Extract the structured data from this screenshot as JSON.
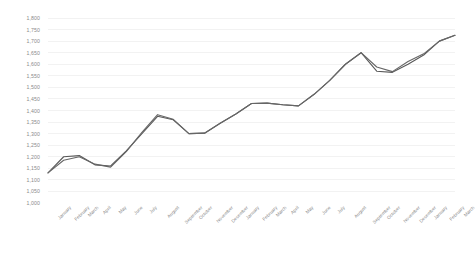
{
  "chart_data": {
    "type": "line",
    "title": "",
    "subtitle": "",
    "xlabel": "",
    "ylabel": "",
    "ylim": [
      1000,
      1800
    ],
    "ytick_step": 50,
    "grid": true,
    "legend": "none",
    "yticks": [
      "1,800",
      "1,750",
      "1,700",
      "1,650",
      "1,600",
      "1,550",
      "1,500",
      "1,450",
      "1,400",
      "1,350",
      "1,300",
      "1,250",
      "1,200",
      "1,150",
      "1,100",
      "1,050",
      "1,000"
    ],
    "ytick_values": [
      1800,
      1750,
      1700,
      1650,
      1600,
      1550,
      1500,
      1450,
      1400,
      1350,
      1300,
      1250,
      1200,
      1150,
      1100,
      1050,
      1000
    ],
    "categories": [
      "January",
      "February",
      "March",
      "April",
      "May",
      "June",
      "July",
      "August",
      "September",
      "October",
      "November",
      "December",
      "January",
      "February",
      "March",
      "April",
      "May",
      "June",
      "July",
      "August",
      "September",
      "October",
      "November",
      "December",
      "January",
      "February",
      "March"
    ],
    "series": [
      {
        "name": "Series 1",
        "color": "#595959",
        "values": [
          1130,
          1200,
          1205,
          1165,
          1160,
          1225,
          1300,
          1375,
          1360,
          1300,
          1302,
          1345,
          1385,
          1430,
          1432,
          1425,
          1420,
          1470,
          1530,
          1600,
          1650,
          1570,
          1565,
          1600,
          1640,
          1700,
          1725
        ]
      },
      {
        "name": "Series 2",
        "color": "#666666",
        "values": [
          1130,
          1185,
          1200,
          1168,
          1155,
          1222,
          1305,
          1382,
          1362,
          1300,
          1302,
          1345,
          1385,
          1430,
          1432,
          1425,
          1420,
          1470,
          1530,
          1600,
          1650,
          1588,
          1568,
          1612,
          1645,
          1700,
          1725
        ]
      }
    ]
  }
}
